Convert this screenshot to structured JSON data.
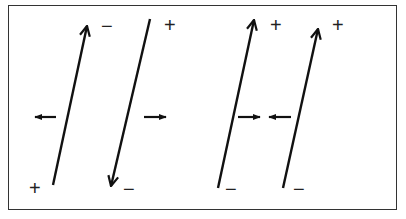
{
  "diagram": {
    "colors": {
      "stroke": "#111111",
      "border": "#333333",
      "background": "#ffffff"
    },
    "segments": [
      {
        "id": "seg1",
        "bottom_label": "+",
        "top_label": "−",
        "arrow": "up"
      },
      {
        "id": "seg2",
        "bottom_label": "−",
        "top_label": "+",
        "arrow": "down"
      },
      {
        "id": "seg3",
        "bottom_label": "−",
        "top_label": "+",
        "arrow": "up"
      },
      {
        "id": "seg4",
        "bottom_label": "−",
        "top_label": "+",
        "arrow": "up"
      }
    ],
    "side_arrows": [
      {
        "id": "a1",
        "direction": "left"
      },
      {
        "id": "a2",
        "direction": "right"
      },
      {
        "id": "a3",
        "direction": "right"
      },
      {
        "id": "a4",
        "direction": "left"
      }
    ]
  }
}
